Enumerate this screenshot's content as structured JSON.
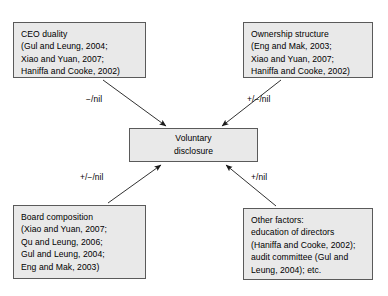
{
  "diagram": {
    "background_color": "#ffffff",
    "node_fill_color": "#e9e9e9",
    "node_border_color": "#5a5a5a",
    "nodes": {
      "ceo_duality": "CEO duality\n(Gul and Leung, 2004;\nXiao and Yuan, 2007;\nHaniffa and Cooke, 2002)",
      "ownership_structure": "Ownership structure\n(Eng and Mak, 2003;\nXiao and Yuan, 2007;\nHaniffa and Cooke, 2002)",
      "central": "Voluntary\ndisclosure",
      "board_composition": "Board composition\n(Xiao and Yuan, 2007;\nQu and Leung, 2006;\nGul and Leung, 2004;\nEng and Mak, 2003)",
      "other_factors": "Other factors:\neducation of directors\n(Haniffa and Cooke, 2002);\naudit committee (Gul and\nLeung, 2004); etc."
    },
    "edge_labels": {
      "ceo_duality_to_central": "−/nil",
      "ownership_structure_to_central": "+/−/nil",
      "board_composition_to_central": "+/−/nil",
      "other_factors_to_central": "+/nil"
    }
  }
}
